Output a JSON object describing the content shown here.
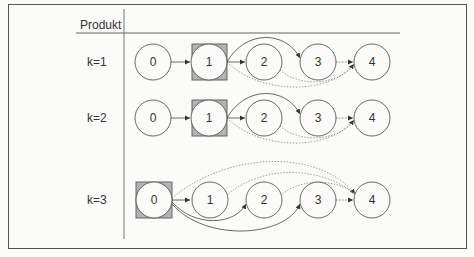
{
  "header": {
    "column_label": "Produkt"
  },
  "rows": [
    {
      "label": "k=1",
      "highlighted_node": "1",
      "nodes": [
        "0",
        "1",
        "2",
        "3",
        "4"
      ]
    },
    {
      "label": "k=2",
      "highlighted_node": "1",
      "nodes": [
        "0",
        "1",
        "2",
        "3",
        "4"
      ]
    },
    {
      "label": "k=3",
      "highlighted_node": "0",
      "nodes": [
        "0",
        "1",
        "2",
        "3",
        "4"
      ]
    }
  ],
  "colors": {
    "line": "#555555",
    "highlight_fill": "#b3b3b3",
    "background": "#fbfbf9"
  }
}
